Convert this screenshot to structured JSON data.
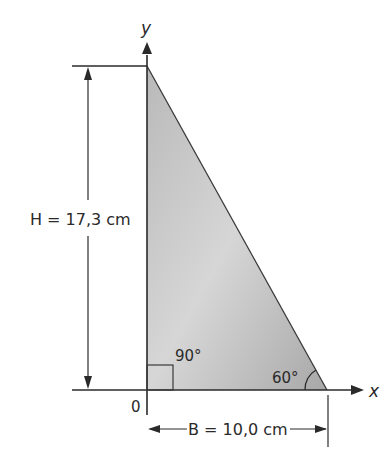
{
  "diagram": {
    "type": "right-triangle",
    "axes": {
      "x_label": "x",
      "y_label": "y",
      "origin_label": "0"
    },
    "height_dimension": {
      "label": "H = 17,3 cm",
      "value": 17.3,
      "unit": "cm"
    },
    "base_dimension": {
      "label": "B = 10,0 cm",
      "value": 10.0,
      "unit": "cm"
    },
    "angles": {
      "right_angle_label": "90°",
      "base_angle_label": "60°"
    },
    "colors": {
      "triangle_fill_light": "#d8d8d8",
      "triangle_fill_dark": "#a9a9a9",
      "stroke": "#2a2a2a"
    }
  }
}
